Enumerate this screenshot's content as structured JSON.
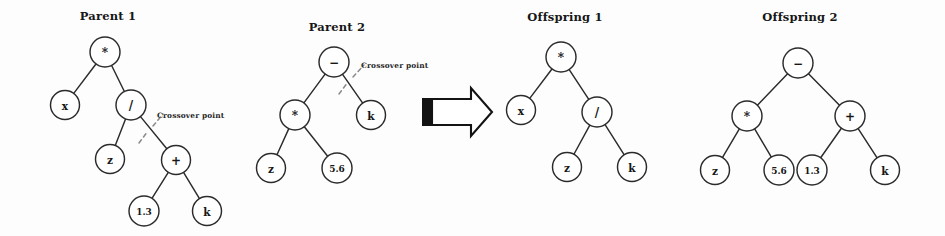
{
  "figure": {
    "background_color": "#fdfdfd",
    "node_stroke_color": "#2b2b2b",
    "cut_line_color": "#8a8a8a",
    "arrow_color": "#131313"
  },
  "panels": [
    {
      "id": "parent-1",
      "title": "Parent 1",
      "title_x": 108,
      "title_y": 20,
      "crossover": {
        "label": "Crossover point",
        "label_x": 157,
        "label_y": 118,
        "line": "M 139,143 L 148,131 M 153,126 L 163,114"
      },
      "nodes": [
        {
          "id": "p1-root",
          "label": "*",
          "x": 105,
          "y": 52,
          "r": 15,
          "size": "op"
        },
        {
          "id": "p1-x",
          "label": "x",
          "x": 65,
          "y": 105,
          "r": 14.5,
          "size": "normal"
        },
        {
          "id": "p1-div",
          "label": "/",
          "x": 131,
          "y": 105,
          "r": 15,
          "size": "op"
        },
        {
          "id": "p1-z",
          "label": "z",
          "x": 110,
          "y": 159,
          "r": 14.5,
          "size": "normal"
        },
        {
          "id": "p1-plus",
          "label": "+",
          "x": 176,
          "y": 160,
          "r": 14.5,
          "size": "op"
        },
        {
          "id": "p1-13",
          "label": "1.3",
          "x": 144,
          "y": 211,
          "r": 15,
          "size": "small"
        },
        {
          "id": "p1-k",
          "label": "k",
          "x": 207,
          "y": 211,
          "r": 14.5,
          "size": "normal"
        }
      ],
      "edges": [
        [
          "p1-root",
          "p1-x"
        ],
        [
          "p1-root",
          "p1-div"
        ],
        [
          "p1-div",
          "p1-z"
        ],
        [
          "p1-div",
          "p1-plus"
        ],
        [
          "p1-plus",
          "p1-13"
        ],
        [
          "p1-plus",
          "p1-k"
        ]
      ]
    },
    {
      "id": "parent-2",
      "title": "Parent 2",
      "title_x": 337,
      "title_y": 31,
      "crossover": {
        "label": "Crossover point",
        "label_x": 361,
        "label_y": 68,
        "line": "M 339,94 L 348,82 M 353,77 L 364,65"
      },
      "nodes": [
        {
          "id": "p2-root",
          "label": "−",
          "x": 334,
          "y": 62,
          "r": 15,
          "size": "op"
        },
        {
          "id": "p2-mul",
          "label": "*",
          "x": 295,
          "y": 115,
          "r": 15,
          "size": "op"
        },
        {
          "id": "p2-k",
          "label": "k",
          "x": 371,
          "y": 115,
          "r": 14.5,
          "size": "normal"
        },
        {
          "id": "p2-z",
          "label": "z",
          "x": 271,
          "y": 168,
          "r": 14.5,
          "size": "normal"
        },
        {
          "id": "p2-56",
          "label": "5.6",
          "x": 337,
          "y": 168,
          "r": 15,
          "size": "small"
        }
      ],
      "edges": [
        [
          "p2-root",
          "p2-mul"
        ],
        [
          "p2-root",
          "p2-k"
        ],
        [
          "p2-mul",
          "p2-z"
        ],
        [
          "p2-mul",
          "p2-56"
        ]
      ]
    },
    {
      "id": "offspring-1",
      "title": "Offspring 1",
      "title_x": 565,
      "title_y": 21,
      "crossover": null,
      "nodes": [
        {
          "id": "o1-root",
          "label": "*",
          "x": 561,
          "y": 57,
          "r": 15,
          "size": "op"
        },
        {
          "id": "o1-x",
          "label": "x",
          "x": 521,
          "y": 110,
          "r": 14.5,
          "size": "normal"
        },
        {
          "id": "o1-div",
          "label": "/",
          "x": 597,
          "y": 112,
          "r": 15,
          "size": "op"
        },
        {
          "id": "o1-z",
          "label": "z",
          "x": 567,
          "y": 167,
          "r": 14.5,
          "size": "normal"
        },
        {
          "id": "o1-k",
          "label": "k",
          "x": 632,
          "y": 167,
          "r": 14.5,
          "size": "normal"
        }
      ],
      "edges": [
        [
          "o1-root",
          "o1-x"
        ],
        [
          "o1-root",
          "o1-div"
        ],
        [
          "o1-div",
          "o1-z"
        ],
        [
          "o1-div",
          "o1-k"
        ]
      ]
    },
    {
      "id": "offspring-2",
      "title": "Offspring 2",
      "title_x": 800,
      "title_y": 21,
      "crossover": null,
      "nodes": [
        {
          "id": "o2-root",
          "label": "−",
          "x": 798,
          "y": 63,
          "r": 15,
          "size": "op"
        },
        {
          "id": "o2-mul",
          "label": "*",
          "x": 747,
          "y": 116,
          "r": 15,
          "size": "op"
        },
        {
          "id": "o2-plus",
          "label": "+",
          "x": 850,
          "y": 116,
          "r": 15,
          "size": "op"
        },
        {
          "id": "o2-z",
          "label": "z",
          "x": 715,
          "y": 170,
          "r": 14.5,
          "size": "normal"
        },
        {
          "id": "o2-56",
          "label": "5.6",
          "x": 779,
          "y": 170,
          "r": 15,
          "size": "small"
        },
        {
          "id": "o2-13",
          "label": "1.3",
          "x": 812,
          "y": 170,
          "r": 15,
          "size": "small"
        },
        {
          "id": "o2-k",
          "label": "k",
          "x": 885,
          "y": 170,
          "r": 14.5,
          "size": "normal"
        }
      ],
      "edges": [
        [
          "o2-root",
          "o2-mul"
        ],
        [
          "o2-root",
          "o2-plus"
        ],
        [
          "o2-mul",
          "o2-z"
        ],
        [
          "o2-mul",
          "o2-56"
        ],
        [
          "o2-plus",
          "o2-13"
        ],
        [
          "o2-plus",
          "o2-k"
        ]
      ]
    }
  ],
  "arrow": {
    "name": "produces-arrow",
    "body_path": "M 432,99 L 471,99 L 471,88 L 492,112 L 471,136 L 471,125 L 432,125 Z",
    "tail_rect": {
      "x": 422,
      "y": 98,
      "width": 11,
      "height": 28
    }
  }
}
